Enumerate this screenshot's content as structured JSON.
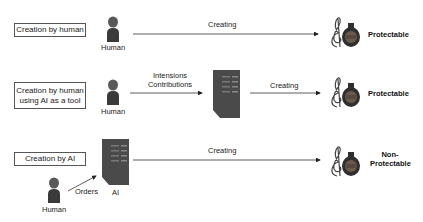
{
  "rows": [
    {
      "category": "Creation by human",
      "actor_label": "Human",
      "arrow_label": "Creating",
      "result": "Protectable"
    },
    {
      "category_line1": "Creation by human",
      "category_line2": "using AI as a tool",
      "actor_label": "Human",
      "arrow1_label_line1": "Intensions",
      "arrow1_label_line2": "Contributions",
      "arrow2_label": "Creating",
      "result": "Protectable"
    },
    {
      "category": "Creation by AI",
      "ai_label": "AI",
      "actor_label": "Human",
      "orders_label": "Orders",
      "arrow_label": "Creating",
      "result_line1": "Non-",
      "result_line2": "Protectable"
    }
  ],
  "colors": {
    "line": "#333333",
    "box_border": "#555555",
    "human_head": "#5a5a5a",
    "human_body": "#3a3a3a",
    "server": "#4a4a4a",
    "music_body": "#2f2f2f"
  }
}
